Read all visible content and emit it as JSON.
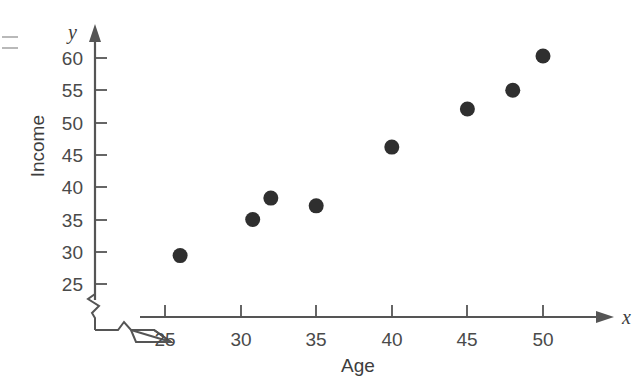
{
  "chart_data": {
    "type": "scatter",
    "title": "",
    "xlabel": "Age",
    "ylabel": "Income",
    "x_axis_symbol": "x",
    "y_axis_symbol": "y",
    "xlim": [
      22.6,
      52.5
    ],
    "ylim": [
      24.0,
      62.5
    ],
    "xticks": [
      25,
      30,
      35,
      40,
      45,
      50
    ],
    "yticks": [
      25,
      30,
      35,
      40,
      45,
      50,
      55,
      60
    ],
    "xtick_labels": [
      "25",
      "30",
      "35",
      "40",
      "45",
      "50"
    ],
    "ytick_labels": [
      "25",
      "30",
      "35",
      "40",
      "45",
      "50",
      "55",
      "60"
    ],
    "axis_break_x": true,
    "axis_break_y": true,
    "grid": false,
    "legend": "none",
    "marker": "filled-circle",
    "marker_color": "#2f2f2f",
    "axis_color": "#555555",
    "points": [
      {
        "x": 26,
        "y": 29.4
      },
      {
        "x": 30.8,
        "y": 35.0
      },
      {
        "x": 32,
        "y": 38.3
      },
      {
        "x": 35,
        "y": 37.1
      },
      {
        "x": 40,
        "y": 46.2
      },
      {
        "x": 45,
        "y": 52.1
      },
      {
        "x": 48,
        "y": 55.0
      },
      {
        "x": 50,
        "y": 60.3
      }
    ]
  }
}
